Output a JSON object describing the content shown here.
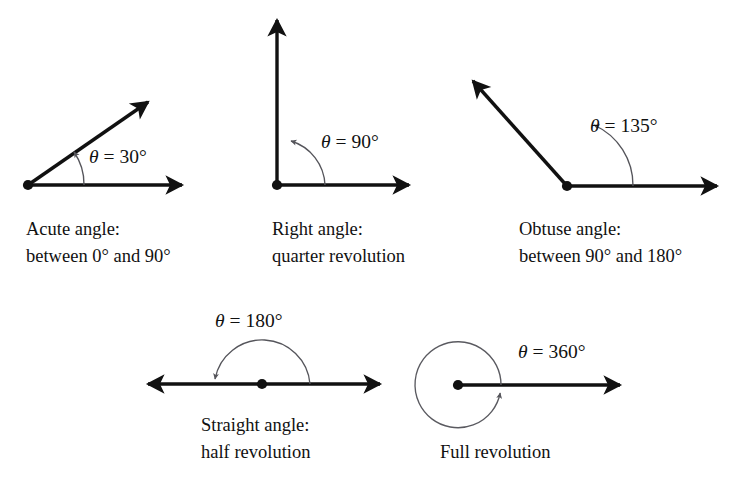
{
  "figure": {
    "background_color": "#ffffff",
    "line_color": "#111111",
    "arc_color": "#55555b",
    "text_color": "#111111"
  },
  "angles": [
    {
      "id": "acute",
      "theta_symbol": "θ",
      "equals": "=",
      "value": "30°",
      "theta_label": "θ = 30°",
      "caption_line1": "Acute angle:",
      "caption_line2": "between 0° and 90°",
      "degrees": 30
    },
    {
      "id": "right",
      "theta_symbol": "θ",
      "equals": "=",
      "value": "90°",
      "theta_label": "θ = 90°",
      "caption_line1": "Right angle:",
      "caption_line2": "quarter revolution",
      "degrees": 90
    },
    {
      "id": "obtuse",
      "theta_symbol": "θ",
      "equals": "=",
      "value": "135°",
      "theta_label": "θ = 135°",
      "caption_line1": "Obtuse angle:",
      "caption_line2": "between 90° and 180°",
      "degrees": 135
    },
    {
      "id": "straight",
      "theta_symbol": "θ",
      "equals": "=",
      "value": "180°",
      "theta_label": "θ = 180°",
      "caption_line1": "Straight angle:",
      "caption_line2": "half revolution",
      "degrees": 180
    },
    {
      "id": "full",
      "theta_symbol": "θ",
      "equals": "=",
      "value": "360°",
      "theta_label": "θ = 360°",
      "caption_line1": "Full revolution",
      "caption_line2": "",
      "degrees": 360
    }
  ]
}
